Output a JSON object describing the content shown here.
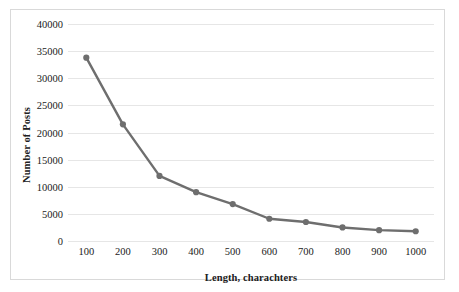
{
  "chart_data": {
    "type": "line",
    "title": "",
    "xlabel": "Length, charachters",
    "ylabel": "Number of Posts",
    "categories": [
      100,
      200,
      300,
      400,
      500,
      600,
      700,
      800,
      900,
      1000
    ],
    "x_tick_labels": [
      "100",
      "200",
      "300",
      "400",
      "500",
      "600",
      "700",
      "800",
      "900",
      "1000"
    ],
    "y_tick_labels": [
      "0",
      "5000",
      "10000",
      "15000",
      "20000",
      "25000",
      "30000",
      "35000",
      "40000"
    ],
    "y_ticks": [
      0,
      5000,
      10000,
      15000,
      20000,
      25000,
      30000,
      35000,
      40000
    ],
    "ylim": [
      0,
      40000
    ],
    "series": [
      {
        "name": "Number of Posts",
        "values": [
          33800,
          21500,
          12000,
          9000,
          6800,
          4100,
          3500,
          2500,
          2000,
          1800
        ],
        "color": "#6e6e6e",
        "marker": "circle"
      }
    ],
    "grid": "horizontal",
    "legend": "none"
  },
  "figure": {
    "border_color": "#d9d9d9",
    "background": "#ffffff",
    "gridline_color": "#e6e6e6",
    "line_color": "#6e6e6e",
    "marker_color": "#6e6e6e"
  }
}
